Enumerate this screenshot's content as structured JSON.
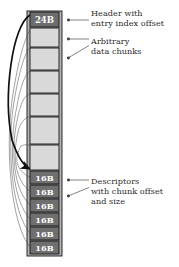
{
  "figure": {
    "kind": "memory-layout-diagram",
    "colors": {
      "header_fill": "#6d6d6d",
      "chunk_fill": "#d9d9d9",
      "descriptor_fill": "#6f6f6f",
      "frame_fill": "#b4b4b4",
      "stroke": "#1a1a1a",
      "text": "#2b2b2b",
      "label_text": "#ffffff",
      "background": "#ffffff"
    },
    "column": {
      "x": 27,
      "y": 11,
      "width": 35,
      "height": 245
    },
    "header": {
      "label": "24B",
      "x": 30,
      "y": 12,
      "width": 29,
      "height": 15
    },
    "chunks": [
      {
        "x": 30,
        "y": 28,
        "width": 29,
        "height": 19
      },
      {
        "x": 30,
        "y": 48,
        "width": 29,
        "height": 22
      },
      {
        "x": 30,
        "y": 71,
        "width": 29,
        "height": 22
      },
      {
        "x": 30,
        "y": 94,
        "width": 29,
        "height": 22
      },
      {
        "x": 30,
        "y": 117,
        "width": 29,
        "height": 27
      },
      {
        "x": 30,
        "y": 145,
        "width": 29,
        "height": 25
      }
    ],
    "descriptors": [
      {
        "label": "16B",
        "x": 30,
        "y": 171,
        "width": 29,
        "height": 13
      },
      {
        "label": "16B",
        "x": 30,
        "y": 185,
        "width": 29,
        "height": 13
      },
      {
        "label": "16B",
        "x": 30,
        "y": 199,
        "width": 29,
        "height": 13
      },
      {
        "label": "16B",
        "x": 30,
        "y": 213,
        "width": 29,
        "height": 13
      },
      {
        "label": "16B",
        "x": 30,
        "y": 227,
        "width": 29,
        "height": 13
      },
      {
        "label": "16B",
        "x": 30,
        "y": 241,
        "width": 29,
        "height": 13
      }
    ],
    "annotations": [
      {
        "id": "header-note",
        "lines": [
          "Header with",
          "entry index offset"
        ],
        "text_x": 92,
        "text_y": 8,
        "leader": {
          "dot_x": 68,
          "dot_y": 20,
          "end_x": 89,
          "end_y": 20
        }
      },
      {
        "id": "chunks-note",
        "lines": [
          "Arbitrary",
          "data chunks"
        ],
        "text_x": 92,
        "text_y": 37,
        "leader_a": {
          "dot_x": 68,
          "dot_y": 39,
          "end_x": 89,
          "end_y": 39
        },
        "leader_b": {
          "dot_x": 68,
          "dot_y": 58,
          "end_x": 89,
          "end_y": 46
        }
      },
      {
        "id": "descriptors-note",
        "lines": [
          "Descriptors",
          "with chunk offset",
          "and size"
        ],
        "text_x": 92,
        "text_y": 177,
        "leader_a": {
          "dot_x": 68,
          "dot_y": 180,
          "end_x": 89,
          "end_y": 180
        },
        "leader_b": {
          "dot_x": 68,
          "dot_y": 196,
          "end_x": 89,
          "end_y": 188
        }
      }
    ],
    "pointer_arcs": {
      "count": 6,
      "description": "thin curved lines from each descriptor to a chunk boundary",
      "primary_arc": {
        "from": "header",
        "to": "first-descriptor",
        "emphasis": "thick"
      }
    }
  }
}
